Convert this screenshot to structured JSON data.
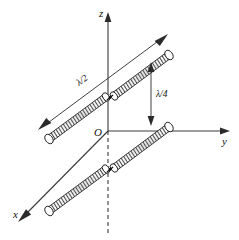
{
  "figure": {
    "axes": {
      "z": {
        "label": "z",
        "direction": "up"
      },
      "y": {
        "label": "y",
        "direction": "right"
      },
      "x": {
        "label": "x",
        "direction": "down-left"
      },
      "origin": {
        "label": "O"
      }
    },
    "dimensions": {
      "length": {
        "label": "λ/2",
        "description": "dipole length"
      },
      "spacing": {
        "label": "λ/4",
        "description": "separation between dipoles"
      }
    },
    "elements": {
      "upper_dipole": {
        "name": "upper half-wave dipole"
      },
      "lower_dipole": {
        "name": "lower half-wave dipole"
      },
      "feed_gap": {
        "name": "center feed gap"
      }
    },
    "colors": {
      "line": "#1a1a1a",
      "axis": "#3a3a3a",
      "hatch": "#2a2a2a",
      "background": "#ffffff"
    }
  }
}
